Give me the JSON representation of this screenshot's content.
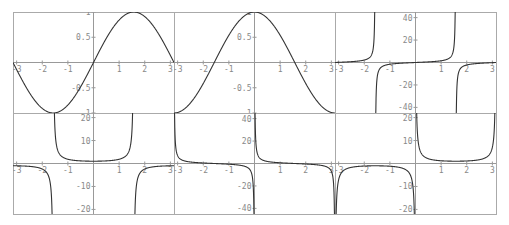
{
  "chart_data": [
    {
      "type": "line",
      "title": "sin(x)",
      "fn": "sin",
      "xlim": [
        -3.14159,
        3.14159
      ],
      "ylim": [
        -1,
        1
      ],
      "xticks": [
        "-3",
        "-2",
        "-1",
        "1",
        "2",
        "3"
      ],
      "yticks": [
        "1",
        "0.5",
        "-0.5",
        "-1"
      ]
    },
    {
      "type": "line",
      "title": "cos(x)",
      "fn": "cos",
      "xlim": [
        -3.14159,
        3.14159
      ],
      "ylim": [
        -1,
        1
      ],
      "xticks": [
        "-3",
        "-2",
        "-1",
        "1",
        "2",
        "3"
      ],
      "yticks": [
        "1",
        "0.5",
        "-0.5",
        "-1"
      ]
    },
    {
      "type": "line",
      "title": "tan(x)",
      "fn": "tan",
      "xlim": [
        -3.14159,
        3.14159
      ],
      "ylim": [
        -45,
        45
      ],
      "xticks": [
        "-3",
        "-2",
        "-1",
        "1",
        "2",
        "3"
      ],
      "yticks": [
        "40",
        "20",
        "-20",
        "-40"
      ]
    },
    {
      "type": "line",
      "title": "sec(x)",
      "fn": "sec",
      "xlim": [
        -3.14159,
        3.14159
      ],
      "ylim": [
        -22,
        22
      ],
      "xticks": [
        "-3",
        "-2",
        "-1",
        "1",
        "2",
        "3"
      ],
      "yticks": [
        "20",
        "10",
        "-10",
        "-20"
      ]
    },
    {
      "type": "line",
      "title": "cot(x)",
      "fn": "cot",
      "xlim": [
        -3.14159,
        3.14159
      ],
      "ylim": [
        -45,
        45
      ],
      "xticks": [
        "-3",
        "-2",
        "-1",
        "1",
        "2",
        "3"
      ],
      "yticks": [
        "40",
        "20",
        "-20",
        "-40"
      ]
    },
    {
      "type": "line",
      "title": "csc(x)",
      "fn": "csc",
      "xlim": [
        -3.14159,
        3.14159
      ],
      "ylim": [
        -22,
        22
      ],
      "xticks": [
        "-3",
        "-2",
        "-1",
        "1",
        "2",
        "3"
      ],
      "yticks": [
        "20",
        "10",
        "-10",
        "-20"
      ]
    }
  ]
}
